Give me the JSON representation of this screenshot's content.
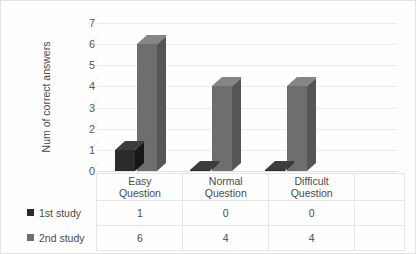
{
  "chart_data": {
    "type": "bar",
    "title": "",
    "xlabel": "",
    "ylabel": "Num of correct answers",
    "categories": [
      "Easy Question",
      "Normal Question",
      "Difficult Question"
    ],
    "category_lines": [
      [
        "Easy",
        "Question"
      ],
      [
        "Normal",
        "Question"
      ],
      [
        "Difficult",
        "Question"
      ]
    ],
    "series": [
      {
        "name": "1st study",
        "values": [
          1,
          0,
          0
        ],
        "color": "#2b2b2b"
      },
      {
        "name": "2nd study",
        "values": [
          6,
          4,
          4
        ],
        "color": "#6e6e6e"
      }
    ],
    "ylim": [
      0,
      7
    ],
    "yticks": [
      7,
      6,
      5,
      4,
      3,
      2,
      1,
      0
    ],
    "grid": true,
    "legend_position": "data-table-left",
    "style": "3d-clustered-column"
  },
  "axis": {
    "y_title": "Num of correct answers"
  },
  "data_table": {
    "row_labels": [
      "1st study",
      "2nd study"
    ],
    "column_headers": [
      "Easy Question",
      "Normal Question",
      "Difficult Question"
    ],
    "rows": [
      {
        "label": "1st study",
        "values": [
          "1",
          "0",
          "0"
        ]
      },
      {
        "label": "2nd study",
        "values": [
          "6",
          "4",
          "4"
        ]
      }
    ]
  },
  "colors": {
    "series1": "#2b2b2b",
    "series1_side": "#171717",
    "series1_top": "#3d3d3d",
    "series2": "#6e6e6e",
    "series2_side": "#565656",
    "series2_top": "#858585",
    "grid": "#ececec",
    "border": "#e3e3e3",
    "text": "#4a4a4a"
  }
}
